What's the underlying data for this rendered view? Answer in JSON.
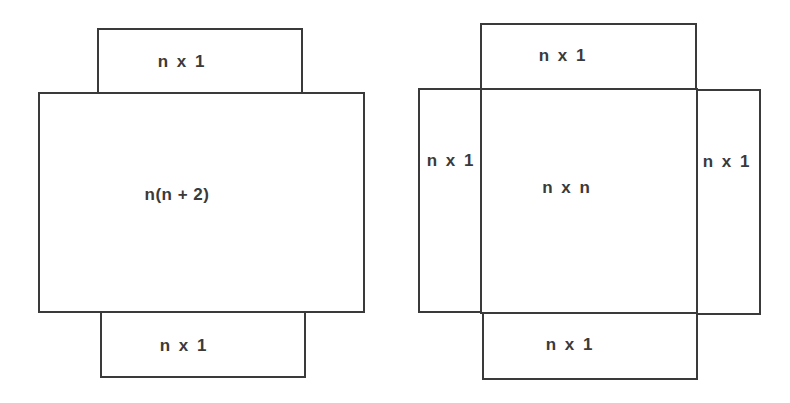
{
  "diagram": {
    "type": "area-decomposition",
    "figures": [
      {
        "name": "rectangle-with-two-strips",
        "regions": [
          {
            "id": "top-strip",
            "label": "n x 1"
          },
          {
            "id": "main-rect",
            "label": "n(n+2)"
          },
          {
            "id": "bottom-strip",
            "label": "n x 1"
          }
        ]
      },
      {
        "name": "square-with-four-strips",
        "regions": [
          {
            "id": "top-strip",
            "label": "n x 1"
          },
          {
            "id": "left-strip",
            "label": "n x 1"
          },
          {
            "id": "center-square",
            "label": "n x n"
          },
          {
            "id": "right-strip",
            "label": "n x 1"
          },
          {
            "id": "bottom-strip",
            "label": "n x 1"
          }
        ]
      }
    ],
    "line_color": "#3a3a3a",
    "background": "#ffffff"
  },
  "left": {
    "top_label": "n x 1",
    "main_label": "n(n + 2)",
    "bottom_label": "n x 1"
  },
  "right": {
    "top_label": "n x 1",
    "left_label": "n x 1",
    "center_label": "n x n",
    "right_label": "n x 1",
    "bottom_label": "n x 1"
  }
}
